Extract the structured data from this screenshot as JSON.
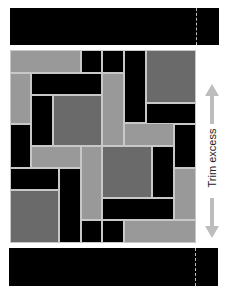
{
  "label": "Trim excess",
  "colors": {
    "black": "#000000",
    "dark": "#6a6a6a",
    "light": "#999999"
  },
  "top_strip": {
    "x": 10,
    "y": 8,
    "w": 209,
    "h": 37,
    "dash_x": 186
  },
  "bottom_strip": {
    "x": 9,
    "y": 248,
    "w": 209,
    "h": 38,
    "dash_x": 186
  },
  "blocks": [
    {
      "x": 0,
      "y": 0,
      "w": 71,
      "h": 23,
      "c": "light"
    },
    {
      "x": 71,
      "y": 0,
      "w": 21,
      "h": 23,
      "c": "black"
    },
    {
      "x": 92,
      "y": 0,
      "w": 22,
      "h": 23,
      "c": "black"
    },
    {
      "x": 114,
      "y": 0,
      "w": 22,
      "h": 73,
      "c": "black"
    },
    {
      "x": 136,
      "y": 0,
      "w": 50,
      "h": 53,
      "c": "dark"
    },
    {
      "x": 136,
      "y": 53,
      "w": 50,
      "h": 21,
      "c": "black"
    },
    {
      "x": 0,
      "y": 23,
      "w": 21,
      "h": 51,
      "c": "light"
    },
    {
      "x": 21,
      "y": 23,
      "w": 71,
      "h": 22,
      "c": "black"
    },
    {
      "x": 92,
      "y": 23,
      "w": 22,
      "h": 73,
      "c": "light"
    },
    {
      "x": 21,
      "y": 45,
      "w": 22,
      "h": 51,
      "c": "black"
    },
    {
      "x": 43,
      "y": 45,
      "w": 49,
      "h": 51,
      "c": "dark"
    },
    {
      "x": 0,
      "y": 74,
      "w": 21,
      "h": 44,
      "c": "black"
    },
    {
      "x": 114,
      "y": 73,
      "w": 50,
      "h": 23,
      "c": "light"
    },
    {
      "x": 164,
      "y": 74,
      "w": 22,
      "h": 44,
      "c": "black"
    },
    {
      "x": 21,
      "y": 96,
      "w": 50,
      "h": 22,
      "c": "light"
    },
    {
      "x": 71,
      "y": 96,
      "w": 21,
      "h": 74,
      "c": "light"
    },
    {
      "x": 92,
      "y": 96,
      "w": 50,
      "h": 52,
      "c": "dark"
    },
    {
      "x": 142,
      "y": 96,
      "w": 22,
      "h": 52,
      "c": "black"
    },
    {
      "x": 0,
      "y": 118,
      "w": 49,
      "h": 22,
      "c": "black"
    },
    {
      "x": 49,
      "y": 118,
      "w": 22,
      "h": 75,
      "c": "black"
    },
    {
      "x": 164,
      "y": 118,
      "w": 22,
      "h": 52,
      "c": "light"
    },
    {
      "x": 0,
      "y": 140,
      "w": 49,
      "h": 53,
      "c": "dark"
    },
    {
      "x": 92,
      "y": 148,
      "w": 72,
      "h": 22,
      "c": "black"
    },
    {
      "x": 71,
      "y": 170,
      "w": 21,
      "h": 23,
      "c": "black"
    },
    {
      "x": 92,
      "y": 170,
      "w": 22,
      "h": 23,
      "c": "black"
    },
    {
      "x": 114,
      "y": 170,
      "w": 72,
      "h": 23,
      "c": "light"
    }
  ]
}
